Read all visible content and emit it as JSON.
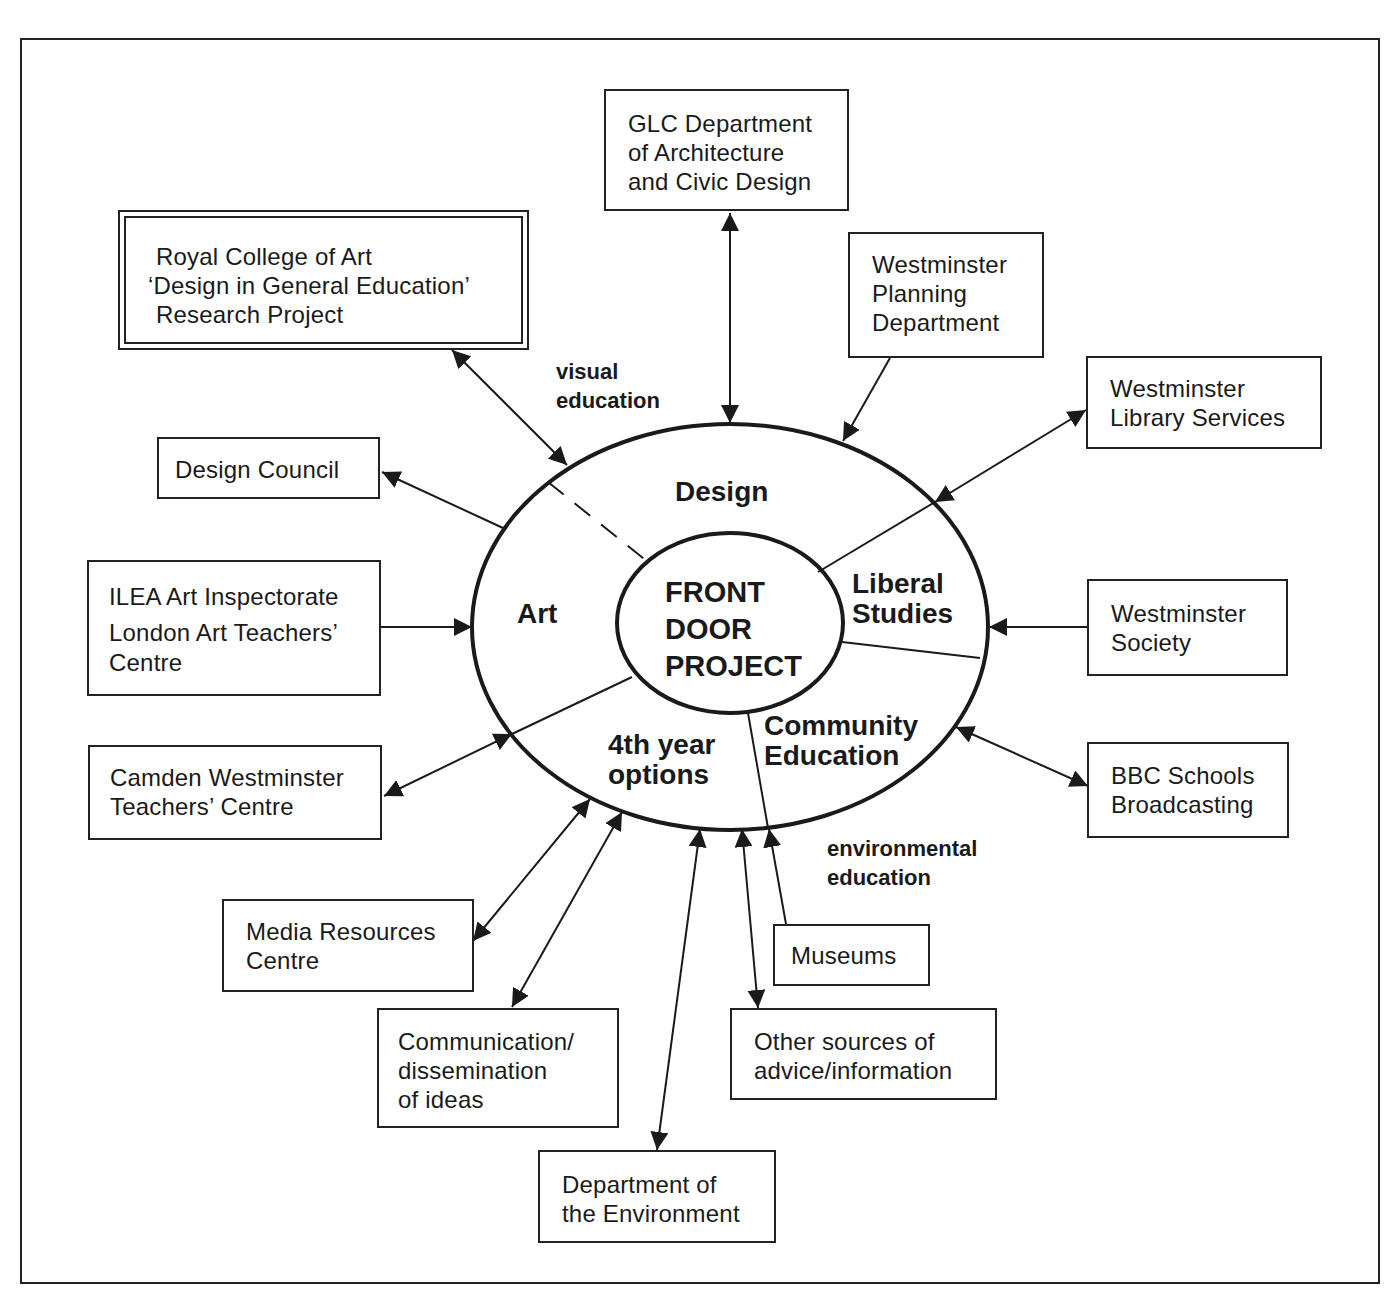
{
  "diagram": {
    "center": {
      "lines": [
        "FRONT",
        "DOOR",
        "PROJECT"
      ]
    },
    "segments": {
      "design": {
        "lines": [
          "Design"
        ]
      },
      "art": {
        "lines": [
          "Art"
        ]
      },
      "liberal_studies": {
        "lines": [
          "Liberal",
          "Studies"
        ]
      },
      "community_education": {
        "lines": [
          "Community",
          "Education"
        ]
      },
      "fourth_year_options": {
        "lines": [
          "4th year",
          "options"
        ]
      }
    },
    "flow_labels": {
      "visual_education": {
        "lines": [
          "visual",
          "education"
        ]
      },
      "environmental_education": {
        "lines": [
          "environmental",
          "education"
        ]
      }
    },
    "nodes": {
      "glc": {
        "lines": [
          "GLC Department",
          "of Architecture",
          "and Civic Design"
        ],
        "arrow": "both"
      },
      "rca": {
        "lines": [
          "Royal College of Art",
          "‘Design in General Education’",
          "Research Project"
        ],
        "arrow": "both",
        "style": "double-border"
      },
      "westminster_planning": {
        "lines": [
          "Westminster",
          "Planning",
          "Department"
        ],
        "arrow": "to-center"
      },
      "westminster_library": {
        "lines": [
          "Westminster",
          "Library Services"
        ],
        "arrow": "to-node"
      },
      "design_council": {
        "lines": [
          "Design Council"
        ],
        "arrow": "to-node"
      },
      "ilea": {
        "lines": [
          "ILEA Art Inspectorate",
          "London Art Teachers’",
          "Centre"
        ],
        "arrow": "to-center"
      },
      "westminster_society": {
        "lines": [
          "Westminster",
          "Society"
        ],
        "arrow": "to-center"
      },
      "camden": {
        "lines": [
          "Camden Westminster",
          "Teachers’ Centre"
        ],
        "arrow": "both"
      },
      "bbc": {
        "lines": [
          "BBC Schools",
          "Broadcasting"
        ],
        "arrow": "both"
      },
      "media": {
        "lines": [
          "Media Resources",
          "Centre"
        ],
        "arrow": "both"
      },
      "communication": {
        "lines": [
          "Communication/",
          "dissemination",
          "of ideas"
        ],
        "arrow": "both"
      },
      "museums": {
        "lines": [
          "Museums"
        ],
        "arrow": "to-center"
      },
      "other_sources": {
        "lines": [
          "Other sources of",
          "advice/information"
        ],
        "arrow": "both"
      },
      "doe": {
        "lines": [
          "Department of",
          "the Environment"
        ],
        "arrow": "both"
      }
    },
    "colors": {
      "ink": "#1a1a1a",
      "background": "#ffffff"
    }
  }
}
